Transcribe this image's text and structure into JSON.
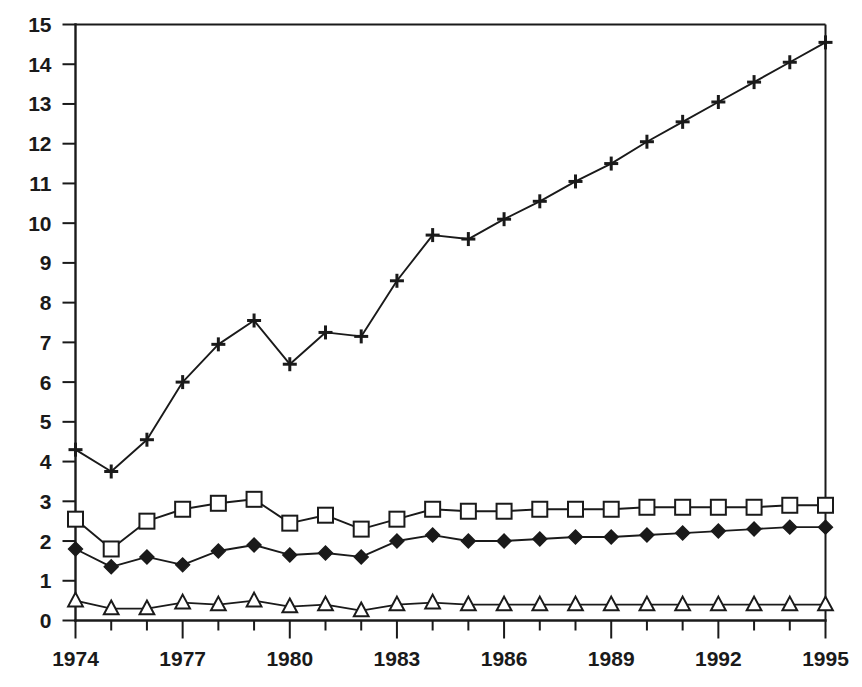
{
  "chart_data": {
    "type": "line",
    "title": "",
    "subtitle": "",
    "xlabel": "",
    "ylabel": "",
    "xlim": [
      1974,
      1995
    ],
    "ylim": [
      0,
      15
    ],
    "grid": false,
    "legend_position": "none",
    "x": [
      1974,
      1975,
      1976,
      1977,
      1978,
      1979,
      1980,
      1981,
      1982,
      1983,
      1984,
      1985,
      1986,
      1987,
      1988,
      1989,
      1990,
      1991,
      1992,
      1993,
      1994,
      1995
    ],
    "x_tick_labels": [
      "1974",
      "1977",
      "1980",
      "1983",
      "1986",
      "1989",
      "1992",
      "1995"
    ],
    "x_tick_values": [
      1974,
      1977,
      1980,
      1983,
      1986,
      1989,
      1992,
      1995
    ],
    "x_minor_tick_values": [
      1975,
      1976,
      1978,
      1979,
      1981,
      1982,
      1984,
      1985,
      1987,
      1988,
      1990,
      1991,
      1993,
      1994
    ],
    "y_tick_labels": [
      "0",
      "1",
      "2",
      "3",
      "4",
      "5",
      "6",
      "7",
      "8",
      "9",
      "10",
      "11",
      "12",
      "13",
      "14",
      "15"
    ],
    "y_tick_values": [
      0,
      1,
      2,
      3,
      4,
      5,
      6,
      7,
      8,
      9,
      10,
      11,
      12,
      13,
      14,
      15
    ],
    "series": [
      {
        "name": "series-plus",
        "marker": "plus",
        "marker_style": "solid",
        "color": "#1a1a1a",
        "values": [
          4.3,
          3.75,
          4.55,
          6.0,
          6.95,
          7.55,
          6.45,
          7.25,
          7.15,
          8.55,
          9.7,
          9.6,
          10.1,
          10.55,
          11.05,
          11.5,
          12.05,
          12.55,
          13.05,
          13.55,
          14.05,
          14.55
        ]
      },
      {
        "name": "series-square",
        "marker": "square",
        "marker_style": "open",
        "color": "#1a1a1a",
        "values": [
          2.55,
          1.8,
          2.5,
          2.8,
          2.95,
          3.05,
          2.45,
          2.65,
          2.3,
          2.55,
          2.8,
          2.75,
          2.75,
          2.8,
          2.8,
          2.8,
          2.85,
          2.85,
          2.85,
          2.85,
          2.9,
          2.9
        ]
      },
      {
        "name": "series-diamond",
        "marker": "diamond",
        "marker_style": "solid",
        "color": "#1a1a1a",
        "values": [
          1.8,
          1.35,
          1.6,
          1.4,
          1.75,
          1.9,
          1.65,
          1.7,
          1.6,
          2.0,
          2.15,
          2.0,
          2.0,
          2.05,
          2.1,
          2.1,
          2.15,
          2.2,
          2.25,
          2.3,
          2.35,
          2.35
        ]
      },
      {
        "name": "series-triangle",
        "marker": "triangle",
        "marker_style": "open",
        "color": "#1a1a1a",
        "values": [
          0.5,
          0.3,
          0.3,
          0.45,
          0.4,
          0.5,
          0.35,
          0.4,
          0.25,
          0.4,
          0.45,
          0.4,
          0.4,
          0.4,
          0.4,
          0.4,
          0.4,
          0.4,
          0.4,
          0.4,
          0.4,
          0.4
        ]
      }
    ]
  },
  "axes": {
    "y_axis_name": "y-axis",
    "x_axis_name": "x-axis"
  }
}
